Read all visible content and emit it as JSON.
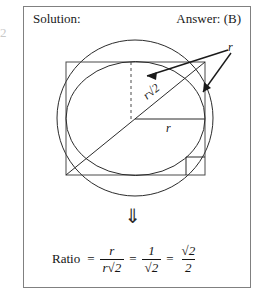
{
  "page": {
    "edge_artifact": "2"
  },
  "header": {
    "solution_label": "Solution:",
    "answer_label": "Answer: (B)"
  },
  "figure": {
    "labels": {
      "r_arrowed": "r",
      "r_diagonal": "r√2",
      "r_horizontal": "r"
    },
    "elements": {
      "outer_circle": "circumscribed-circle",
      "square": "inscribed-square",
      "inner_circle": "inscribed-circle",
      "diagonal": "square-diagonal",
      "dashed_line": "vertical-dashed-radius",
      "right_angle_marker": "right-angle-square"
    },
    "colors": {
      "stroke": "#2b2b2b",
      "border": "#808080",
      "text": "#141414"
    }
  },
  "transition": {
    "arrow_glyph": "⇓"
  },
  "formula": {
    "label": "Ratio",
    "equals": "=",
    "term1": {
      "numerator": "r",
      "denominator": "r√2"
    },
    "term2": {
      "numerator": "1",
      "denominator": "√2"
    },
    "term3": {
      "numerator": "√2",
      "denominator": "2"
    }
  }
}
